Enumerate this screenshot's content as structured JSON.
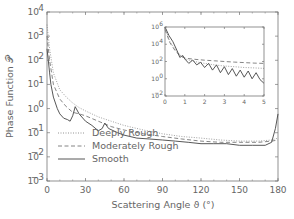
{
  "chart_data": [
    {
      "type": "line",
      "title": "",
      "xlabel": "Scattering Angle ϑ (°)",
      "ylabel": "Phase Function 𝒫",
      "xlim": [
        0,
        180
      ],
      "ylim": [
        0.001,
        10000
      ],
      "yscale": "log",
      "xticks": [
        "0",
        "30",
        "60",
        "90",
        "120",
        "150",
        "180"
      ],
      "yticks": [
        "10⁻³",
        "10⁻²",
        "10⁻¹",
        "10⁰",
        "10¹",
        "10²",
        "10³",
        "10⁴"
      ],
      "grid": false,
      "legend_position": "lower-middle",
      "series": [
        {
          "name": "Deeply Rough",
          "style": "dotted",
          "x": [
            0,
            2,
            5,
            10,
            15,
            20,
            25,
            30,
            40,
            50,
            60,
            75,
            90,
            105,
            120,
            135,
            150,
            165,
            175,
            180
          ],
          "y": [
            3000,
            300,
            30,
            6,
            3,
            1.7,
            1.1,
            0.8,
            0.45,
            0.3,
            0.2,
            0.13,
            0.09,
            0.07,
            0.06,
            0.05,
            0.045,
            0.045,
            0.05,
            0.06
          ]
        },
        {
          "name": "Moderately Rough",
          "style": "dashed",
          "x": [
            0,
            2,
            5,
            10,
            15,
            20,
            25,
            30,
            40,
            50,
            60,
            75,
            90,
            105,
            120,
            135,
            150,
            165,
            175,
            180
          ],
          "y": [
            1000,
            100,
            10,
            2.5,
            1.2,
            0.7,
            0.6,
            0.5,
            0.3,
            0.18,
            0.13,
            0.09,
            0.07,
            0.055,
            0.045,
            0.04,
            0.04,
            0.04,
            0.045,
            0.05
          ]
        },
        {
          "name": "Smooth",
          "style": "solid",
          "x": [
            0,
            1,
            2,
            3,
            5,
            8,
            10,
            13,
            16,
            18,
            20,
            22,
            25,
            30,
            35,
            40,
            43,
            45,
            48,
            55,
            60,
            70,
            80,
            90,
            100,
            110,
            120,
            130,
            140,
            150,
            160,
            170,
            175,
            178,
            180
          ],
          "y": [
            300,
            100,
            30,
            10,
            3,
            1.0,
            0.6,
            0.4,
            0.35,
            0.3,
            0.5,
            1.2,
            0.6,
            0.3,
            0.2,
            0.12,
            0.15,
            0.25,
            0.15,
            0.1,
            0.08,
            0.06,
            0.055,
            0.05,
            0.045,
            0.04,
            0.035,
            0.035,
            0.035,
            0.03,
            0.03,
            0.03,
            0.04,
            0.15,
            0.6
          ]
        }
      ]
    },
    {
      "type": "line",
      "title": "inset",
      "xlim": [
        0,
        5
      ],
      "ylim": [
        0.01,
        1000000
      ],
      "yscale": "log",
      "xticks": [
        "0",
        "1",
        "2",
        "3",
        "4",
        "5"
      ],
      "yticks": [
        "10⁻²",
        "10⁰",
        "10²",
        "10⁴",
        "10⁶"
      ],
      "series": [
        {
          "name": "Deeply Rough",
          "style": "dotted",
          "x": [
            0,
            0.25,
            0.5,
            0.75,
            1,
            1.5,
            2,
            2.5,
            3,
            3.5,
            4,
            4.5,
            5
          ],
          "y": [
            1000000,
            20000,
            3000,
            600,
            200,
            100,
            60,
            40,
            30,
            25,
            20,
            18,
            16
          ]
        },
        {
          "name": "Moderately Rough",
          "style": "dashed",
          "x": [
            0,
            0.25,
            0.5,
            0.75,
            1,
            1.5,
            2,
            2.5,
            3,
            3.5,
            4,
            4.5,
            5
          ],
          "y": [
            500000,
            15000,
            2000,
            500,
            250,
            180,
            140,
            120,
            100,
            85,
            75,
            65,
            60
          ]
        },
        {
          "name": "Smooth",
          "style": "solid",
          "x": [
            0,
            0.2,
            0.4,
            0.6,
            0.75,
            0.9,
            1.0,
            1.2,
            1.4,
            1.6,
            1.8,
            2.0,
            2.2,
            2.4,
            2.6,
            2.8,
            3.0,
            3.2,
            3.4,
            3.6,
            3.8,
            4.0,
            4.2,
            4.4,
            4.6,
            4.8,
            5.0
          ],
          "y": [
            1000000,
            100000,
            20000,
            2000,
            300,
            500,
            200,
            60,
            150,
            40,
            80,
            20,
            60,
            10,
            40,
            5,
            25,
            3,
            15,
            2,
            10,
            1.5,
            8,
            1,
            5,
            0.8,
            0.3
          ]
        }
      ]
    }
  ],
  "labels": {
    "xlabel": "Scattering Angle ϑ (°)",
    "ylabel": "Phase Function 𝒫",
    "legend": [
      "Deeply Rough",
      "Moderately Rough",
      "Smooth"
    ]
  }
}
